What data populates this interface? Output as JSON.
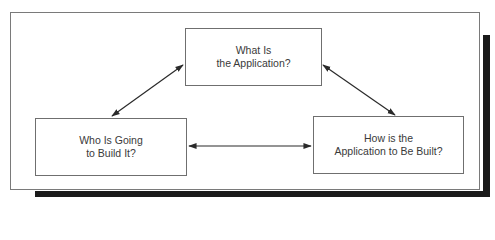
{
  "diagram": {
    "nodes": [
      {
        "id": "what",
        "lines": [
          "What Is",
          "the Application?"
        ]
      },
      {
        "id": "who",
        "lines": [
          "Who Is Going",
          "to Build It?"
        ]
      },
      {
        "id": "how",
        "lines": [
          "How is the",
          "Application to Be Built?"
        ]
      }
    ],
    "edges": [
      {
        "from": "what",
        "to": "who",
        "direction": "bidirectional"
      },
      {
        "from": "what",
        "to": "how",
        "direction": "bidirectional"
      },
      {
        "from": "who",
        "to": "how",
        "direction": "bidirectional"
      }
    ],
    "colors": {
      "line": "#2a2a2a",
      "box_border": "#6f6f6f",
      "frame_border": "#7a7a7a",
      "shadow": "#1a1a1a",
      "text": "#3a3a3a"
    }
  }
}
